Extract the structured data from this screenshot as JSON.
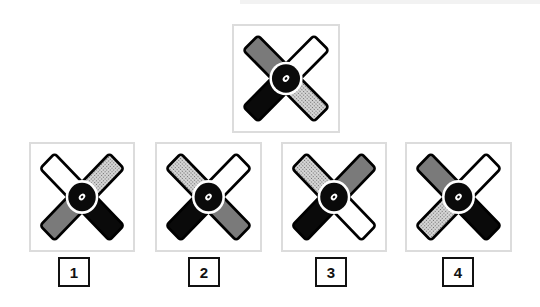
{
  "colors": {
    "black": "#0a0a0a",
    "gray": "#7a7a7a",
    "white": "#ffffff",
    "dotted_bg": "#d8d8d8",
    "dotted_dot": "#6a6a6a",
    "panel_border": "#dcdcdc"
  },
  "question": {
    "figure": {
      "arms": {
        "top_left": "gray",
        "top_right": "white",
        "bottom_left": "black",
        "bottom_right": "dotted"
      }
    }
  },
  "options": [
    {
      "label": "1",
      "arms": {
        "top_left": "white",
        "top_right": "dotted",
        "bottom_left": "gray",
        "bottom_right": "black"
      }
    },
    {
      "label": "2",
      "arms": {
        "top_left": "dotted",
        "top_right": "white",
        "bottom_left": "black",
        "bottom_right": "gray"
      }
    },
    {
      "label": "3",
      "arms": {
        "top_left": "dotted",
        "top_right": "gray",
        "bottom_left": "black",
        "bottom_right": "white"
      }
    },
    {
      "label": "4",
      "arms": {
        "top_left": "gray",
        "top_right": "white",
        "bottom_left": "dotted",
        "bottom_right": "black"
      }
    }
  ]
}
